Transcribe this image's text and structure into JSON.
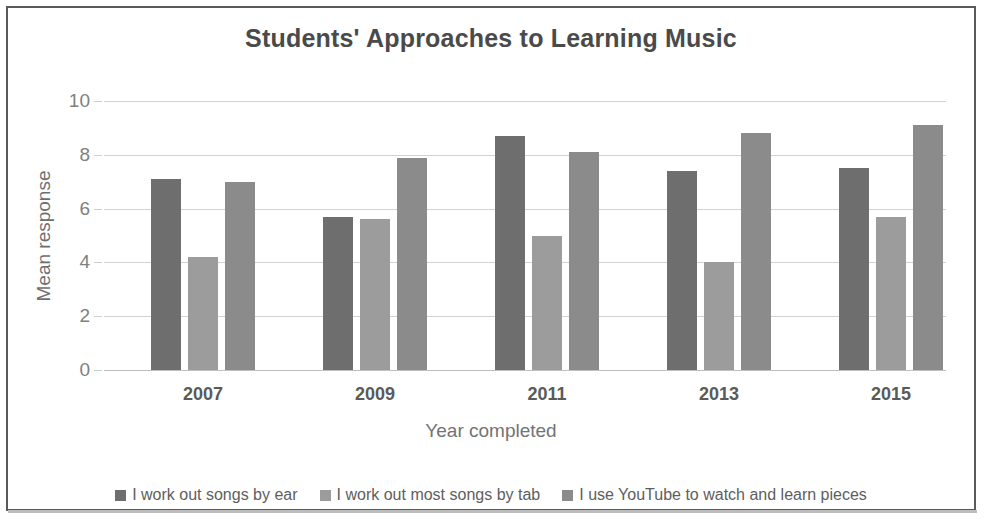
{
  "chart_data": {
    "type": "bar",
    "title": "Students' Approaches to Learning Music",
    "xlabel": "Year completed",
    "ylabel": "Mean response",
    "categories": [
      "2007",
      "2009",
      "2011",
      "2013",
      "2015"
    ],
    "ylim": [
      0,
      10
    ],
    "yticks": [
      0,
      2,
      4,
      6,
      8,
      10
    ],
    "ytick_labels": [
      "0",
      "2",
      "4",
      "6",
      "8",
      "10"
    ],
    "grid": true,
    "legend_position": "bottom",
    "series": [
      {
        "name": "I work out songs by ear",
        "color": "#6e6e6e",
        "values": [
          7.1,
          5.7,
          8.7,
          7.4,
          7.5
        ]
      },
      {
        "name": "I work out most songs by tab",
        "color": "#9c9c9c",
        "values": [
          4.2,
          5.6,
          5.0,
          4.0,
          5.7
        ]
      },
      {
        "name": "I use YouTube to watch and learn pieces",
        "color": "#8b8b8b",
        "values": [
          7.0,
          7.9,
          8.1,
          8.8,
          9.1
        ]
      }
    ]
  }
}
